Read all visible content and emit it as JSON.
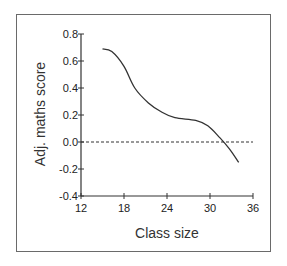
{
  "chart_data": {
    "type": "line",
    "title": "",
    "xlabel": "Class size",
    "ylabel": "Adj. maths score",
    "xlim": [
      12,
      36
    ],
    "ylim": [
      -0.4,
      0.8
    ],
    "xticks": [
      "12",
      "18",
      "24",
      "30",
      "36"
    ],
    "yticks": [
      "-0.4",
      "-0.2",
      "0.0",
      "0.2",
      "0.4",
      "0.6",
      "0.8"
    ],
    "grid": false,
    "legend": null,
    "reference_line": {
      "y": 0.0,
      "style": "dashed"
    },
    "series": [
      {
        "name": "Adj. maths score",
        "x": [
          15,
          16.3,
          18,
          19.5,
          21.4,
          23.3,
          25.1,
          28,
          29.7,
          31.4,
          32.7,
          34
        ],
        "y": [
          0.69,
          0.67,
          0.56,
          0.4,
          0.29,
          0.22,
          0.18,
          0.16,
          0.12,
          0.03,
          -0.05,
          -0.15
        ]
      }
    ]
  }
}
